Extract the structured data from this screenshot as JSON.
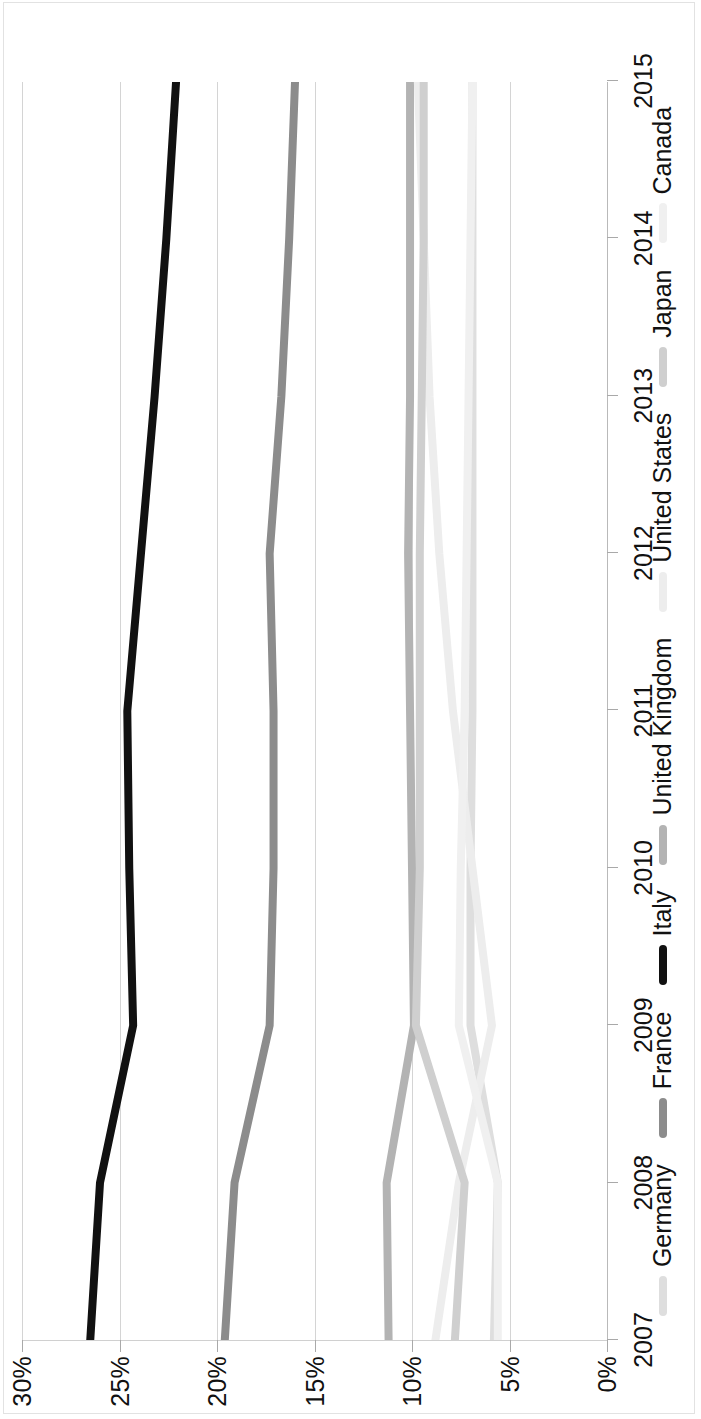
{
  "chart_data": {
    "type": "line",
    "title": "",
    "xlabel": "",
    "ylabel": "",
    "x": [
      2007,
      2008,
      2009,
      2010,
      2011,
      2012,
      2013,
      2014,
      2015
    ],
    "categories": [
      "2007",
      "2008",
      "2009",
      "2010",
      "2011",
      "2012",
      "2013",
      "2014",
      "2015"
    ],
    "ytick_labels": [
      "30%",
      "25%",
      "20%",
      "15%",
      "10%",
      "5%",
      "0%"
    ],
    "ytick_values": [
      30,
      25,
      20,
      15,
      10,
      5,
      0
    ],
    "ylim": [
      0,
      30
    ],
    "xlim": [
      2007,
      2015
    ],
    "grid": true,
    "legend_position": "bottom",
    "series": [
      {
        "name": "Germany",
        "color": "#dedede",
        "values": [
          5.8,
          5.6,
          7.0,
          7.0,
          6.9,
          6.9,
          6.9,
          6.9,
          6.9
        ]
      },
      {
        "name": "France",
        "color": "#8c8c8c",
        "values": [
          19.6,
          19.1,
          17.3,
          17.1,
          17.1,
          17.3,
          16.7,
          16.3,
          16.0
        ]
      },
      {
        "name": "Italy",
        "color": "#111111",
        "values": [
          26.5,
          26.0,
          24.3,
          24.5,
          24.6,
          23.9,
          23.2,
          22.6,
          22.1
        ]
      },
      {
        "name": "United Kingdom",
        "color": "#b3b3b3",
        "values": [
          11.2,
          11.3,
          9.9,
          10.0,
          10.1,
          10.2,
          10.1,
          10.1,
          10.1
        ]
      },
      {
        "name": "United States",
        "color": "#ededed",
        "values": [
          8.8,
          7.6,
          5.9,
          6.9,
          7.9,
          8.6,
          9.1,
          9.4,
          9.7
        ]
      },
      {
        "name": "Japan",
        "color": "#cfcfcf",
        "values": [
          7.8,
          7.3,
          9.8,
          9.6,
          9.6,
          9.6,
          9.5,
          9.4,
          9.4
        ]
      },
      {
        "name": "Canada",
        "color": "#f0f0f0",
        "values": [
          5.6,
          5.6,
          7.6,
          7.5,
          7.3,
          7.2,
          7.1,
          7.0,
          6.9
        ]
      }
    ]
  },
  "legend": {
    "items": [
      {
        "label": "Germany"
      },
      {
        "label": "France"
      },
      {
        "label": "Italy"
      },
      {
        "label": "United Kingdom"
      },
      {
        "label": "United States"
      },
      {
        "label": "Japan"
      },
      {
        "label": "Canada"
      }
    ]
  }
}
